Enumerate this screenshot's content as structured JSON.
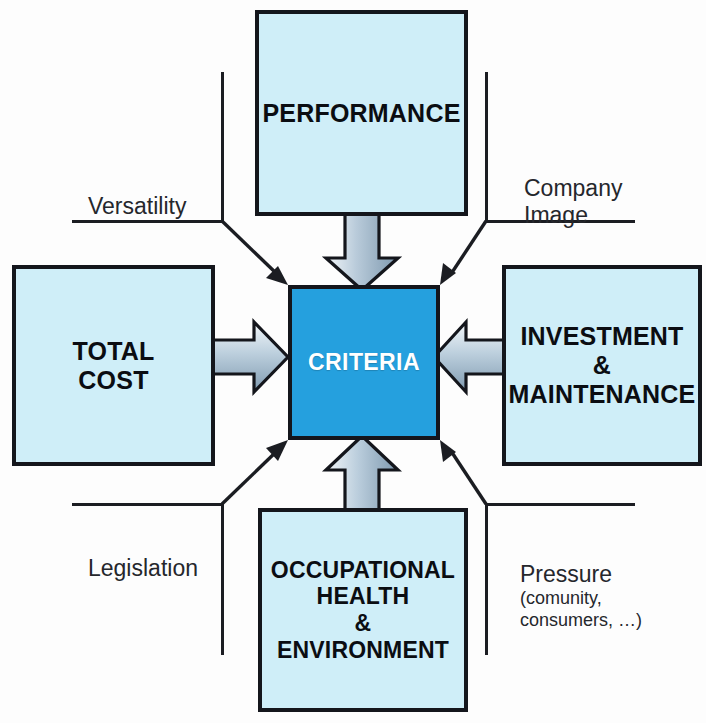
{
  "diagram": {
    "center": {
      "label": "CRITERIA",
      "color": "#25a0de",
      "text_color": "#ffffff"
    },
    "box_color": "#cfeef8",
    "border_color": "#14161c",
    "arrow_fill_light": "#e7edf3",
    "arrow_fill_dark": "#8fa7bb",
    "boxes": [
      {
        "id": "performance",
        "label": "PERFORMANCE",
        "position": "top"
      },
      {
        "id": "total-cost",
        "label": "TOTAL\nCOST",
        "position": "left"
      },
      {
        "id": "investment",
        "label": "INVESTMENT\n&\nMAINTENANCE",
        "position": "right"
      },
      {
        "id": "occupational",
        "label": "OCCUPATIONAL\nHEALTH\n&\nENVIRONMENT",
        "position": "bottom"
      }
    ],
    "corner_labels": [
      {
        "id": "versatility",
        "label": "Versatility",
        "sub": "",
        "position": "top-left"
      },
      {
        "id": "company-image",
        "label": "Company\nImage",
        "sub": "",
        "position": "top-right"
      },
      {
        "id": "legislation",
        "label": "Legislation",
        "sub": "",
        "position": "bottom-left"
      },
      {
        "id": "pressure",
        "label": "Pressure",
        "sub": "(comunity,\nconsumers, …)",
        "position": "bottom-right"
      }
    ]
  }
}
